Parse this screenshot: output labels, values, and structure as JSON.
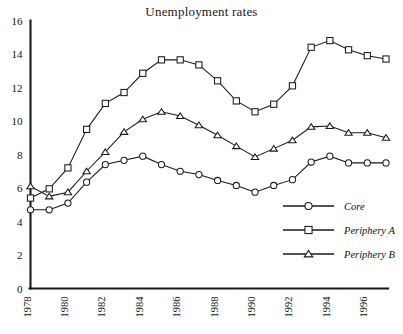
{
  "chart_data": {
    "type": "line",
    "title": "Unemployment rates",
    "xlabel": "",
    "ylabel": "",
    "xlim": [
      1978,
      1997
    ],
    "ylim": [
      0,
      16
    ],
    "grid": false,
    "legend_position": "bottom-right",
    "y_ticks": [
      0,
      2,
      4,
      6,
      8,
      10,
      12,
      14,
      16
    ],
    "y_tick_labels": [
      "0",
      "2",
      "4",
      "6",
      "8",
      "10",
      "12",
      "14",
      "16"
    ],
    "x": [
      1978,
      1979,
      1980,
      1981,
      1982,
      1983,
      1984,
      1985,
      1986,
      1987,
      1988,
      1989,
      1990,
      1991,
      1992,
      1993,
      1994,
      1995,
      1996,
      1997
    ],
    "x_ticks": [
      1978,
      1980,
      1982,
      1984,
      1986,
      1988,
      1990,
      1992,
      1994,
      1996
    ],
    "x_tick_labels": [
      "1978",
      "1980",
      "1982",
      "1984",
      "1986",
      "1988",
      "1990",
      "1992",
      "1994",
      "1996"
    ],
    "series": [
      {
        "name": "Core",
        "marker": "circle",
        "color": "#1a1a1a",
        "values": [
          4.7,
          4.7,
          5.1,
          6.35,
          7.4,
          7.65,
          7.9,
          7.4,
          7.0,
          6.8,
          6.45,
          6.15,
          5.75,
          6.15,
          6.5,
          7.55,
          7.9,
          7.5,
          7.5,
          7.5
        ]
      },
      {
        "name": "Periphery A",
        "marker": "square",
        "color": "#1a1a1a",
        "values": [
          5.4,
          5.95,
          7.2,
          9.5,
          11.05,
          11.7,
          12.85,
          13.65,
          13.65,
          13.35,
          12.4,
          11.2,
          10.55,
          11.0,
          12.1,
          14.4,
          14.8,
          14.25,
          13.9,
          13.7
        ]
      },
      {
        "name": "Periphery B",
        "marker": "triangle",
        "color": "#1a1a1a",
        "values": [
          6.1,
          5.5,
          5.75,
          7.0,
          8.15,
          9.35,
          10.1,
          10.55,
          10.3,
          9.75,
          9.15,
          8.5,
          7.85,
          8.35,
          8.85,
          9.65,
          9.7,
          9.3,
          9.3,
          9.0
        ]
      }
    ]
  },
  "legend": {
    "entries": [
      {
        "label": "Core"
      },
      {
        "label": "Periphery A"
      },
      {
        "label": "Periphery B"
      }
    ]
  }
}
